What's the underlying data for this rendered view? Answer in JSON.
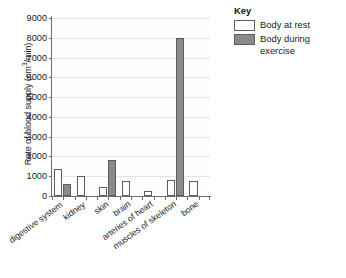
{
  "chart_data": {
    "type": "bar",
    "title": "",
    "xlabel": "",
    "ylabel": "Rate of blood supply (cm3/min)",
    "ylabel_prefix": "Rate of blood supply (cm",
    "ylabel_superscript": "3",
    "ylabel_suffix": "/min)",
    "categories": [
      "digestive system",
      "kidney",
      "skin",
      "brain",
      "arteries of heart",
      "muscles of skeleton",
      "bone"
    ],
    "series": [
      {
        "name": "Body at rest",
        "values": [
          1350,
          1000,
          450,
          750,
          250,
          800,
          750
        ]
      },
      {
        "name": "Body during exercise",
        "values": [
          600,
          0,
          1800,
          0,
          0,
          8000,
          0
        ]
      }
    ],
    "ylim": [
      0,
      9000
    ],
    "ytick_values": [
      0,
      1000,
      2000,
      3000,
      4000,
      5000,
      6000,
      7000,
      8000,
      9000
    ],
    "ytick_labels": [
      "0",
      "1000",
      "2000",
      "3000",
      "4000",
      "5000",
      "6000",
      "7000",
      "8000",
      "9000"
    ],
    "grid": true,
    "legend_position": "top-right"
  },
  "legend": {
    "title": "Key",
    "entries": [
      {
        "label": "Body at rest",
        "swatch": "white",
        "color": "#ffffff"
      },
      {
        "label": "Body during exercise",
        "swatch": "gray",
        "color": "#8a8a8a"
      }
    ]
  },
  "colors": {
    "rest_fill": "#ffffff",
    "exercise_fill": "#8a8a8a",
    "bar_outline": "#5d5d5d",
    "axis": "#6e6e6e",
    "gridline": "#e3e3e3",
    "text": "#1a1a1a",
    "background": "#ffffff"
  }
}
